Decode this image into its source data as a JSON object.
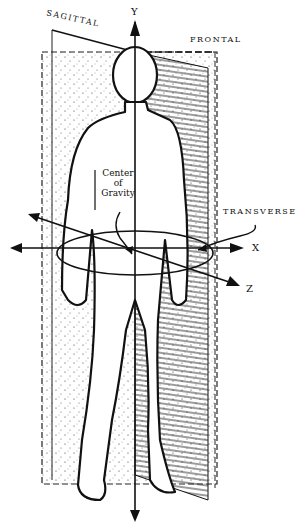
{
  "diagram": {
    "planes": {
      "sagittal": "SAGITTAL",
      "frontal": "FRONTAL",
      "transverse": "TRANSVERSE"
    },
    "axes": {
      "y": "Y",
      "x": "X",
      "z": "Z"
    },
    "center_of_gravity": {
      "line1": "Center",
      "line2": "of",
      "line3": "Gravity"
    },
    "colors": {
      "ink": "#111111",
      "background": "#ffffff"
    }
  }
}
